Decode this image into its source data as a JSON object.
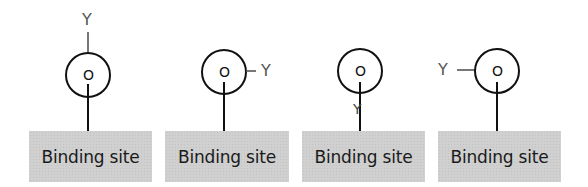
{
  "diagram": {
    "panels": [
      {
        "id": 1,
        "center_label": "O",
        "substituent_label": "Y",
        "substituent_position": "top",
        "binding_site_label": "Binding site"
      },
      {
        "id": 2,
        "center_label": "O",
        "substituent_label": "Y",
        "substituent_position": "right",
        "binding_site_label": "Binding site"
      },
      {
        "id": 3,
        "center_label": "O",
        "substituent_label": "Y",
        "substituent_position": "bottom",
        "binding_site_label": "Binding site"
      },
      {
        "id": 4,
        "center_label": "O",
        "substituent_label": "Y",
        "substituent_position": "left",
        "binding_site_label": "Binding site"
      }
    ],
    "colors": {
      "binding_site_fill": "#d0d0d0",
      "stroke": "#111111",
      "substituent_text": "#555555"
    }
  }
}
